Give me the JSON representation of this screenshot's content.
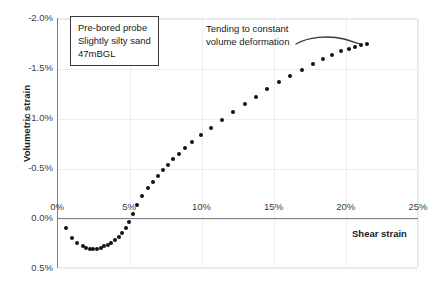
{
  "chart_data": {
    "type": "scatter",
    "title": "",
    "xlabel": "Shear strain",
    "ylabel": "Volumetric strain",
    "xlim": [
      0,
      25
    ],
    "ylim": [
      0.5,
      -2.0
    ],
    "xticks": [
      "0%",
      "5%",
      "10%",
      "15%",
      "20%",
      "25%"
    ],
    "xtick_values": [
      0,
      5,
      10,
      15,
      20,
      25
    ],
    "yticks": [
      "-2.0%",
      "-1.5%",
      "-1.0%",
      "-0.5%",
      "0.0%",
      "0.5%"
    ],
    "ytick_values": [
      -2.0,
      -1.5,
      -1.0,
      -0.5,
      0.0,
      0.5
    ],
    "grid": true,
    "legend": "none",
    "series": [
      {
        "name": "Pre-bored probe test",
        "marker": "circle",
        "color": "#121212",
        "points": [
          [
            0.55,
            0.09
          ],
          [
            1.0,
            0.19
          ],
          [
            1.35,
            0.24
          ],
          [
            1.7,
            0.27
          ],
          [
            1.95,
            0.285
          ],
          [
            2.2,
            0.295
          ],
          [
            2.45,
            0.3
          ],
          [
            2.7,
            0.295
          ],
          [
            2.95,
            0.285
          ],
          [
            3.2,
            0.27
          ],
          [
            3.45,
            0.255
          ],
          [
            3.7,
            0.235
          ],
          [
            3.95,
            0.21
          ],
          [
            4.2,
            0.175
          ],
          [
            4.45,
            0.135
          ],
          [
            4.7,
            0.085
          ],
          [
            4.95,
            0.025
          ],
          [
            5.2,
            -0.05
          ],
          [
            5.5,
            -0.14
          ],
          [
            5.85,
            -0.235
          ],
          [
            6.2,
            -0.31
          ],
          [
            6.55,
            -0.375
          ],
          [
            6.9,
            -0.435
          ],
          [
            7.25,
            -0.49
          ],
          [
            7.6,
            -0.545
          ],
          [
            7.95,
            -0.6
          ],
          [
            8.35,
            -0.655
          ],
          [
            8.8,
            -0.715
          ],
          [
            9.3,
            -0.775
          ],
          [
            9.9,
            -0.845
          ],
          [
            10.6,
            -0.915
          ],
          [
            11.35,
            -0.99
          ],
          [
            12.15,
            -1.07
          ],
          [
            12.95,
            -1.15
          ],
          [
            13.7,
            -1.225
          ],
          [
            14.5,
            -1.3
          ],
          [
            15.3,
            -1.37
          ],
          [
            16.1,
            -1.43
          ],
          [
            16.9,
            -1.49
          ],
          [
            17.65,
            -1.55
          ],
          [
            18.35,
            -1.6
          ],
          [
            19.0,
            -1.645
          ],
          [
            19.6,
            -1.68
          ],
          [
            20.15,
            -1.705
          ],
          [
            20.6,
            -1.725
          ],
          [
            21.0,
            -1.74
          ],
          [
            21.4,
            -1.755
          ]
        ]
      }
    ],
    "annotations": [
      {
        "name": "test-info-box",
        "lines": [
          "Pre-bored probe",
          "Slightly silty sand",
          "47mBGL"
        ]
      },
      {
        "name": "constant-volume-note",
        "lines": [
          "Tending to constant",
          "volume deformation"
        ]
      }
    ]
  },
  "axis": {
    "x_title": "Shear strain",
    "y_title": "Volumetric strain"
  },
  "info_box": {
    "line1": "Pre-bored probe",
    "line2": "Slightly silty sand",
    "line3": "47mBGL"
  },
  "callout": {
    "line1": "Tending to constant",
    "line2": "volume deformation"
  }
}
